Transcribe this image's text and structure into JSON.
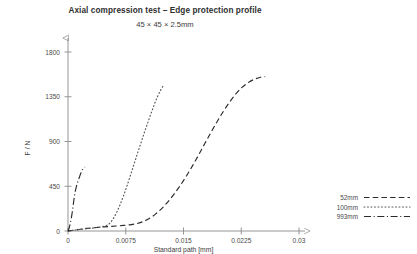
{
  "chart_data": {
    "type": "line",
    "title": "Axial compression test – Edge protection profile",
    "subtitle": "45 × 45 × 2.5mm",
    "xlabel": "Standard path  [mm]",
    "ylabel": "F / N",
    "xlim": [
      0,
      0.0335
    ],
    "ylim": [
      0,
      1900
    ],
    "xticks": [
      "0",
      "0.0075",
      "0.015",
      "0.0225",
      "0.03"
    ],
    "xtick_values": [
      0,
      0.0075,
      0.015,
      0.0225,
      0.03
    ],
    "yticks": [
      "0",
      "450",
      "900",
      "1350",
      "1800"
    ],
    "ytick_values": [
      0,
      450,
      900,
      1350,
      1800
    ],
    "grid": false,
    "legend_position": "right",
    "axis_arrows": true,
    "series": [
      {
        "name": "52mm",
        "style": "dashed",
        "color": "#2b2b2b",
        "points": [
          [
            0.0,
            0
          ],
          [
            0.0008,
            8
          ],
          [
            0.0016,
            18
          ],
          [
            0.0024,
            26
          ],
          [
            0.0032,
            32
          ],
          [
            0.0042,
            38
          ],
          [
            0.0052,
            44
          ],
          [
            0.0062,
            50
          ],
          [
            0.0072,
            56
          ],
          [
            0.0082,
            64
          ],
          [
            0.009,
            76
          ],
          [
            0.0098,
            96
          ],
          [
            0.0106,
            128
          ],
          [
            0.0114,
            172
          ],
          [
            0.0122,
            228
          ],
          [
            0.013,
            296
          ],
          [
            0.0138,
            374
          ],
          [
            0.0146,
            460
          ],
          [
            0.0154,
            556
          ],
          [
            0.0162,
            660
          ],
          [
            0.017,
            770
          ],
          [
            0.0178,
            884
          ],
          [
            0.0186,
            996
          ],
          [
            0.0194,
            1104
          ],
          [
            0.0202,
            1206
          ],
          [
            0.021,
            1298
          ],
          [
            0.0218,
            1378
          ],
          [
            0.0226,
            1444
          ],
          [
            0.0234,
            1492
          ],
          [
            0.0242,
            1526
          ],
          [
            0.025,
            1546
          ],
          [
            0.0256,
            1552
          ]
        ]
      },
      {
        "name": "100mm",
        "style": "dotted",
        "color": "#555555",
        "points": [
          [
            0.0,
            0
          ],
          [
            0.001,
            10
          ],
          [
            0.002,
            20
          ],
          [
            0.003,
            28
          ],
          [
            0.0038,
            36
          ],
          [
            0.0046,
            46
          ],
          [
            0.0052,
            64
          ],
          [
            0.0056,
            94
          ],
          [
            0.006,
            140
          ],
          [
            0.0064,
            200
          ],
          [
            0.0068,
            272
          ],
          [
            0.0072,
            352
          ],
          [
            0.0076,
            440
          ],
          [
            0.008,
            534
          ],
          [
            0.0084,
            630
          ],
          [
            0.0088,
            726
          ],
          [
            0.0092,
            822
          ],
          [
            0.0096,
            916
          ],
          [
            0.01,
            1008
          ],
          [
            0.0104,
            1098
          ],
          [
            0.0108,
            1186
          ],
          [
            0.0112,
            1270
          ],
          [
            0.0116,
            1348
          ],
          [
            0.012,
            1412
          ],
          [
            0.0123,
            1452
          ]
        ]
      },
      {
        "name": "993mm",
        "style": "dashdot",
        "color": "#2b2b2b",
        "points": [
          [
            0.0,
            0
          ],
          [
            0.00015,
            30
          ],
          [
            0.0003,
            78
          ],
          [
            0.00045,
            140
          ],
          [
            0.0006,
            214
          ],
          [
            0.00072,
            286
          ],
          [
            0.00084,
            352
          ],
          [
            0.00096,
            404
          ],
          [
            0.00108,
            444
          ],
          [
            0.0012,
            478
          ],
          [
            0.00135,
            512
          ],
          [
            0.0015,
            546
          ],
          [
            0.00165,
            578
          ],
          [
            0.0018,
            606
          ],
          [
            0.00195,
            626
          ],
          [
            0.0021,
            638
          ],
          [
            0.00222,
            642
          ]
        ]
      }
    ]
  },
  "legend": {
    "items": [
      {
        "label": "52mm",
        "style": "dashed"
      },
      {
        "label": "100mm",
        "style": "dotted"
      },
      {
        "label": "993mm",
        "style": "dashdot"
      }
    ]
  }
}
